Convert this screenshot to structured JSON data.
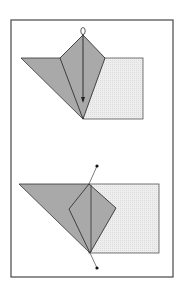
{
  "diagram": {
    "title": "",
    "frame": {
      "x": 11,
      "y": 20,
      "width": 162,
      "height": 257,
      "stroke": "#555555"
    },
    "colors": {
      "dark_fill": "#a9a9a9",
      "light_fill": "#ebebeb",
      "stroke": "#333333",
      "dot": "#111111"
    },
    "steps": [
      {
        "id": "step-1",
        "description": "Kite flap folded down along arrow",
        "square": {
          "x": 83,
          "y": 58,
          "width": 60,
          "height": 61
        },
        "triangle": [
          [
            21,
            58
          ],
          [
            83,
            58
          ],
          [
            83,
            119
          ]
        ],
        "kite": [
          [
            83,
            35
          ],
          [
            105,
            58
          ],
          [
            83,
            119
          ],
          [
            60,
            58
          ]
        ],
        "arrow": {
          "from": [
            83,
            33
          ],
          "to": [
            83,
            103
          ]
        },
        "loop": {
          "cx": 83,
          "cy": 31,
          "r": 3
        }
      },
      {
        "id": "step-2",
        "description": "Result with fold line marked by endpoints",
        "square": {
          "x": 89,
          "y": 184,
          "width": 70,
          "height": 69
        },
        "triangle": [
          [
            19,
            184
          ],
          [
            89,
            184
          ],
          [
            90,
            253
          ]
        ],
        "kite": [
          [
            89,
            184
          ],
          [
            116,
            208
          ],
          [
            90,
            253
          ],
          [
            69,
            209
          ]
        ],
        "fold_line": {
          "from": [
            97,
            166
          ],
          "to": [
            97,
            268
          ],
          "through_top": [
            89,
            184
          ],
          "through_bottom": [
            90,
            253
          ]
        },
        "dots": [
          [
            97,
            166
          ],
          [
            97,
            268
          ]
        ]
      }
    ]
  }
}
